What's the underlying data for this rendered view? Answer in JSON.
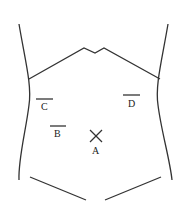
{
  "diagram": {
    "stroke_color": "#333333",
    "markers": [
      {
        "id": "A",
        "label": "A",
        "shape": "cross"
      },
      {
        "id": "B",
        "label": "B",
        "shape": "bar"
      },
      {
        "id": "C",
        "label": "C",
        "shape": "bar"
      },
      {
        "id": "D",
        "label": "D",
        "shape": "bar"
      }
    ]
  }
}
